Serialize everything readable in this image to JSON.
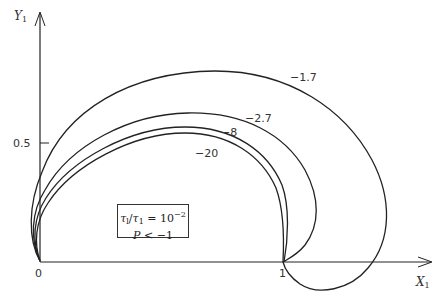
{
  "figure": {
    "y_axis_label": "Y",
    "y_axis_sub": "1",
    "x_axis_label": "X",
    "x_axis_sub": "1",
    "tick_origin": "0",
    "tick_x_1": "1",
    "tick_y_05": "0.5"
  },
  "legend": {
    "line1_tau": "τ",
    "line1_tau_sub": "l",
    "line1_slash": "/",
    "line1_tau2": "τ",
    "line1_tau2_sub": "1",
    "line1_eq": " = 10",
    "line1_exp": "−2",
    "line2_p": "P",
    "line2_rest": " < −1"
  },
  "curves": [
    {
      "label": "−1.7",
      "color": "#222222"
    },
    {
      "label": "−2.7",
      "color": "#222222"
    },
    {
      "label": "−8",
      "color": "#222222"
    },
    {
      "label": "−20",
      "color": "#222222"
    }
  ]
}
